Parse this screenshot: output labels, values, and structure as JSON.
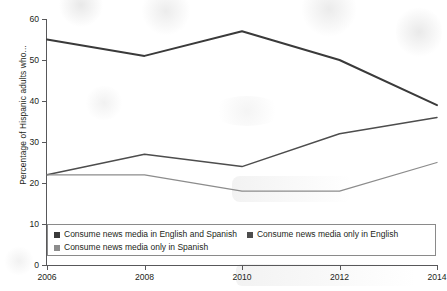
{
  "chart_data": {
    "type": "line",
    "title": "",
    "xlabel": "",
    "ylabel": "Percentage of Hispanic adults who...",
    "x": [
      2006,
      2008,
      2010,
      2012,
      2014
    ],
    "categories": [
      "2006",
      "2008",
      "2010",
      "2012",
      "2014"
    ],
    "xticklabels": [
      "2006",
      "2008",
      "2010",
      "2012",
      "2014"
    ],
    "yticklabels": [
      "0",
      "10",
      "20",
      "30",
      "40",
      "50",
      "60"
    ],
    "yticks": [
      0,
      10,
      20,
      30,
      40,
      50,
      60
    ],
    "ylim": [
      0,
      60
    ],
    "xlim": [
      2006,
      2014
    ],
    "grid": false,
    "legend_position": "bottom",
    "series": [
      {
        "name": "Consume news media in English and Spanish",
        "color": "#3a3a3a",
        "values": [
          55,
          51,
          57,
          50,
          39
        ]
      },
      {
        "name": "Consume news media only in English",
        "color": "#4d4d4d",
        "values": [
          22,
          27,
          24,
          32,
          36
        ]
      },
      {
        "name": "Consume news media only in Spanish",
        "color": "#8c8c8c",
        "values": [
          22,
          22,
          18,
          18,
          25
        ]
      }
    ]
  },
  "axis": {
    "y_title": "Percentage of Hispanic adults who...",
    "y_ticks": [
      "60",
      "50",
      "40",
      "30",
      "20",
      "10",
      "0"
    ],
    "x_ticks": [
      "2006",
      "2008",
      "2010",
      "2012",
      "2014"
    ]
  },
  "legend": {
    "items": [
      {
        "label": "Consume news media in English and Spanish",
        "color": "#3a3a3a"
      },
      {
        "label": "Consume news media only in English",
        "color": "#4d4d4d"
      },
      {
        "label": "Consume news media only in Spanish",
        "color": "#8c8c8c"
      }
    ]
  }
}
